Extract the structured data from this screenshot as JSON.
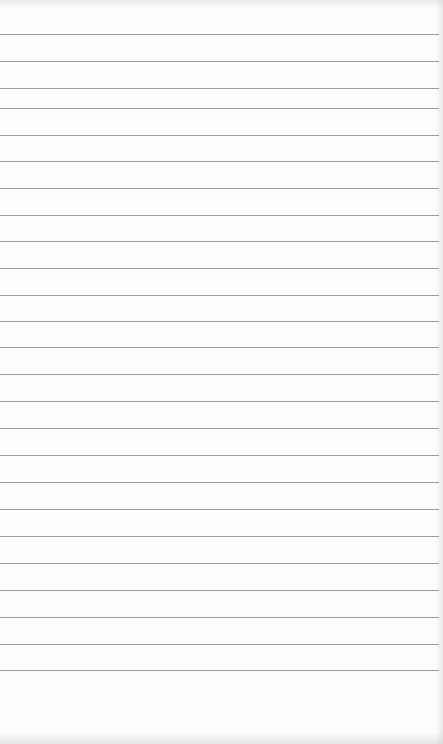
{
  "document": {
    "type": "blank lined paper sheet",
    "background_color": "#fdfdfd",
    "rule_color": "#9c9c9c",
    "rule_count": 26,
    "rule_positions_y": [
      34,
      61,
      88,
      108,
      135,
      161,
      188,
      215,
      241,
      268,
      295,
      321,
      347,
      374,
      401,
      428,
      455,
      482,
      509,
      536,
      563,
      590,
      617,
      644,
      670
    ],
    "text_content": ""
  }
}
